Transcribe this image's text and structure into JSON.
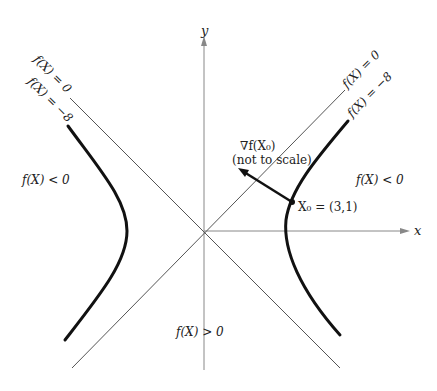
{
  "axes": {
    "x_label": "x",
    "y_label": "y",
    "origin_px": [
      204,
      231
    ]
  },
  "asymptotes": {
    "left_label": "f(X) = 0",
    "right_label": "f(X) = 0"
  },
  "level_curves": {
    "left_label": "f(X) = −8",
    "right_label": "f(X) = −8"
  },
  "regions": {
    "left": "f(X) < 0",
    "right": "f(X) < 0",
    "bottom": "f(X) > 0"
  },
  "gradient": {
    "label": "∇f(X₀)",
    "note": "(not to scale)"
  },
  "point": {
    "label": "X₀ = (3,1)"
  },
  "colors": {
    "line": "#555555",
    "curve": "#111111",
    "text": "#222222"
  }
}
